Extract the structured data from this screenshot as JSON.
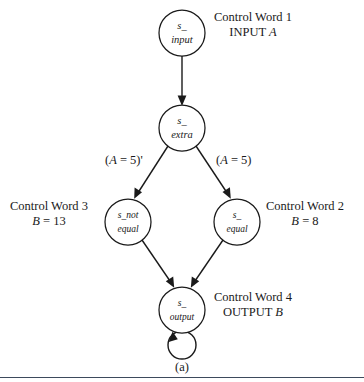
{
  "figure": {
    "caption": "(a)",
    "colors": {
      "ink": "#1a1a1a",
      "background": "#ffffff",
      "rule": "#3d4a5c"
    }
  },
  "nodes": [
    {
      "id": "s_input",
      "label_line1": "s_",
      "label_line2": "input",
      "cx": 182,
      "cy": 33,
      "r": 23
    },
    {
      "id": "s_extra",
      "label_line1": "s_",
      "label_line2": "extra",
      "cx": 182,
      "cy": 128,
      "r": 23
    },
    {
      "id": "s_not_equal",
      "label_line1": "s_not",
      "label_line2": "equal",
      "cx": 128,
      "cy": 222,
      "r": 23
    },
    {
      "id": "s_equal",
      "label_line1": "s_",
      "label_line2": "equal",
      "cx": 237,
      "cy": 222,
      "r": 23
    },
    {
      "id": "s_output",
      "label_line1": "s_",
      "label_line2": "output",
      "cx": 182,
      "cy": 310,
      "r": 23
    }
  ],
  "edges": [
    {
      "id": "input-to-extra",
      "from": "s_input",
      "to": "s_extra",
      "label": ""
    },
    {
      "id": "extra-to-not-equal",
      "from": "s_extra",
      "to": "s_not_equal",
      "label": "(A = 5)'"
    },
    {
      "id": "extra-to-equal",
      "from": "s_extra",
      "to": "s_equal",
      "label": "(A = 5)"
    },
    {
      "id": "not-equal-to-output",
      "from": "s_not_equal",
      "to": "s_output",
      "label": ""
    },
    {
      "id": "equal-to-output",
      "from": "s_equal",
      "to": "s_output",
      "label": ""
    },
    {
      "id": "output-self-loop",
      "from": "s_output",
      "to": "s_output",
      "label": ""
    }
  ],
  "edge_labels": {
    "left": {
      "prefix": "(",
      "var": "A",
      "rest": " = 5)'"
    },
    "right": {
      "prefix": "(",
      "var": "A",
      "rest": " = 5)"
    }
  },
  "annotations": {
    "control_word_1": {
      "line1": "Control Word 1",
      "line2_prefix": "INPUT ",
      "line2_var": "A"
    },
    "control_word_2": {
      "line1": "Control Word 2",
      "line2_var": "B",
      "line2_rest": " = 8"
    },
    "control_word_3": {
      "line1": "Control Word 3",
      "line2_var": "B",
      "line2_rest": " = 13"
    },
    "control_word_4": {
      "line1": "Control Word 4",
      "line2_prefix": "OUTPUT ",
      "line2_var": "B"
    }
  }
}
